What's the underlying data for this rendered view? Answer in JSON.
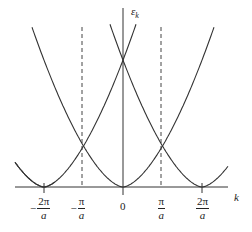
{
  "figure": {
    "title": "",
    "y_axis_label": "ε",
    "y_axis_subscript": "k",
    "x_axis_label": "k",
    "colors": {
      "curve": "#333333",
      "axis": "#333333",
      "dashed": "#444444",
      "background": "#ffffff"
    }
  },
  "ticks": [
    {
      "sign": "−",
      "num": "2π",
      "den": "a",
      "x": 44
    },
    {
      "sign": "−",
      "num": "π",
      "den": "a",
      "x": 82
    },
    {
      "sign": "",
      "num": "0",
      "den": "",
      "x": 123
    },
    {
      "sign": "",
      "num": "π",
      "den": "a",
      "x": 161
    },
    {
      "sign": "",
      "num": "2π",
      "den": "a",
      "x": 202
    }
  ]
}
